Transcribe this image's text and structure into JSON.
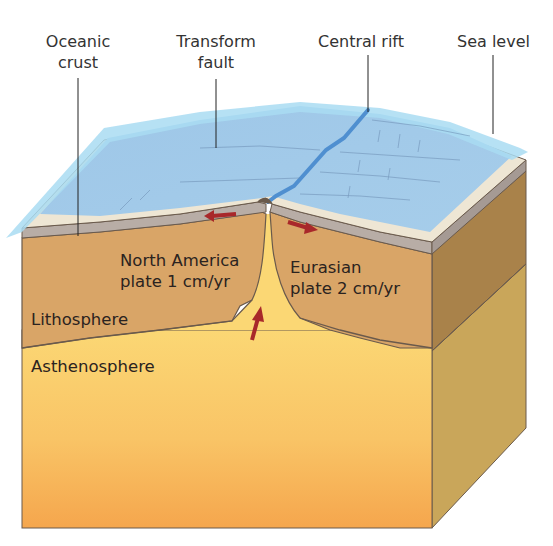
{
  "diagram": {
    "labels": {
      "oceanic_crust": [
        "Oceanic",
        "crust"
      ],
      "transform_fault": [
        "Transform",
        "fault"
      ],
      "central_rift": "Central rift",
      "sea_level": "Sea level",
      "north_america": [
        "North America",
        "plate 1 cm/yr"
      ],
      "eurasian": [
        "Eurasian",
        "plate 2 cm/yr"
      ],
      "lithosphere": "Lithosphere",
      "asthenosphere": "Asthenosphere"
    },
    "plates": [
      {
        "name": "North America",
        "speed": "1 cm/yr",
        "direction": "left"
      },
      {
        "name": "Eurasian",
        "speed": "2 cm/yr",
        "direction": "right"
      }
    ],
    "arrows": [
      {
        "name": "north-america-motion",
        "direction": "left"
      },
      {
        "name": "eurasian-motion",
        "direction": "right"
      },
      {
        "name": "magma-upwelling",
        "direction": "up"
      }
    ],
    "colors": {
      "sea_water": "#8fc6e8",
      "sea_level_sheet": "#a9dcf2",
      "sea_floor": "#9cc5e6",
      "crust_light": "#ece4d2",
      "crust_gray": "#b7aca6",
      "lithosphere": "#d9a567",
      "lithosphere_side": "#a98242",
      "asthenosphere_top": "#fbd774",
      "asthenosphere_bottom": "#f5a94e",
      "asthenosphere_side": "#c9a458",
      "arrow": "#a8282a",
      "outline": "#6a5a4c",
      "leader_line": "#222222"
    }
  }
}
